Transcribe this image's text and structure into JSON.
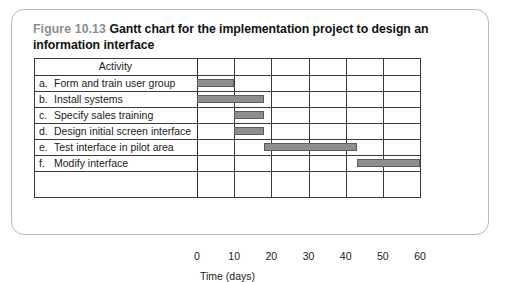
{
  "figure": {
    "number": "Figure 10.13",
    "caption": "Gantt chart for the implementation project to design an information interface"
  },
  "table": {
    "header": "Activity"
  },
  "chart_data": {
    "type": "bar",
    "orientation": "horizontal",
    "subtype": "gantt",
    "title": "Gantt chart for the implementation project to design an information interface",
    "xlabel": "Time (days)",
    "ylabel": "Activity",
    "xlim": [
      0,
      60
    ],
    "xticks": [
      "0",
      "10",
      "20",
      "30",
      "40",
      "50",
      "60"
    ],
    "xtick_values": [
      0,
      10,
      20,
      30,
      40,
      50,
      60
    ],
    "grid": true,
    "legend": "none",
    "bar_color": "#8e8e8e",
    "bar_edge_color": "#5d5d5d",
    "categories": [
      "a.  Form and train user group",
      "b.  Install systems",
      "c.  Specify sales training",
      "d.  Design initial screen interface",
      "e.  Test interface in pilot area",
      "f.   Modify interface"
    ],
    "tasks": [
      {
        "letter": "a.",
        "label": "Form and train user group",
        "start": 0,
        "end": 10,
        "duration": 10
      },
      {
        "letter": "b.",
        "label": "Install systems",
        "start": 0,
        "end": 18,
        "duration": 18
      },
      {
        "letter": "c.",
        "label": "Specify sales training",
        "start": 10,
        "end": 18,
        "duration": 8
      },
      {
        "letter": "d.",
        "label": "Design initial screen interface",
        "start": 10,
        "end": 18,
        "duration": 8
      },
      {
        "letter": "e.",
        "label": "Test interface in pilot area",
        "start": 18,
        "end": 43,
        "duration": 25
      },
      {
        "letter": "f.",
        "label": "Modify interface",
        "start": 43,
        "end": 60,
        "duration": 17
      }
    ]
  }
}
